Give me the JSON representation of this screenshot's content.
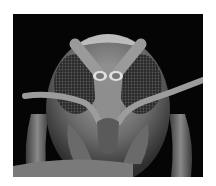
{
  "image": {
    "subject": "scanning electron micrograph of insect head, frontal view",
    "colors": {
      "background": "#ffffff",
      "photo_background": "#050505",
      "body_gray": "#6e6e6e",
      "highlight": "#c8c8c8"
    }
  }
}
